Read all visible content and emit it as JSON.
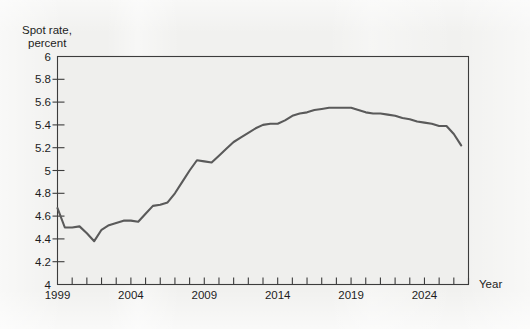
{
  "figure": {
    "background_color": "#f1f1ef",
    "plot_background_color": "#efefed",
    "line_color": "#5a5a5a",
    "axis_color": "#3c3c3c",
    "text_color": "#1d1d1d"
  },
  "axes": {
    "y_title_line1": "Spot rate,",
    "y_title_line2": "percent",
    "x_title": "Year"
  },
  "chart_data": {
    "type": "line",
    "title": "",
    "subtitle": "",
    "xlabel": "Year",
    "ylabel": "Spot rate, percent",
    "xlim": [
      1999,
      2027
    ],
    "ylim": [
      4,
      6
    ],
    "grid": false,
    "legend": null,
    "y_ticks": [
      4,
      4.2,
      4.4,
      4.6,
      4.8,
      5,
      5.2,
      5.4,
      5.6,
      5.8,
      6
    ],
    "y_tick_labels": [
      "4",
      "4.2",
      "4.4",
      "4.6",
      "4.8",
      "5",
      "5.2",
      "5.4",
      "5.6",
      "5.8",
      "6"
    ],
    "x_ticks": [
      1999,
      2000,
      2001,
      2002,
      2003,
      2004,
      2005,
      2006,
      2007,
      2008,
      2009,
      2010,
      2011,
      2012,
      2013,
      2014,
      2015,
      2016,
      2017,
      2018,
      2019,
      2020,
      2021,
      2022,
      2023,
      2024,
      2025,
      2026,
      2027
    ],
    "x_tick_labels": [
      "1999",
      "",
      "",
      "",
      "",
      "2004",
      "",
      "",
      "",
      "",
      "2009",
      "",
      "",
      "",
      "",
      "2014",
      "",
      "",
      "",
      "",
      "2019",
      "",
      "",
      "",
      "",
      "2024",
      "",
      "",
      ""
    ],
    "x_labeled_ticks": [
      1999,
      2004,
      2009,
      2014,
      2019,
      2024
    ],
    "series": [
      {
        "name": "Spot rate",
        "x": [
          1999,
          1999.5,
          2000,
          2000.5,
          2001,
          2001.5,
          2002,
          2002.5,
          2003,
          2003.5,
          2004,
          2004.5,
          2005,
          2005.5,
          2006,
          2006.5,
          2007,
          2007.5,
          2008,
          2008.5,
          2009,
          2009.5,
          2010,
          2010.5,
          2011,
          2011.5,
          2012,
          2012.5,
          2013,
          2013.5,
          2014,
          2014.5,
          2015,
          2015.5,
          2016,
          2016.5,
          2017,
          2017.5,
          2018,
          2018.5,
          2019,
          2019.5,
          2020,
          2020.5,
          2021,
          2021.5,
          2022,
          2022.5,
          2023,
          2023.5,
          2024,
          2024.5,
          2025,
          2025.5,
          2026,
          2026.5
        ],
        "y": [
          4.67,
          4.5,
          4.5,
          4.51,
          4.45,
          4.38,
          4.48,
          4.52,
          4.54,
          4.56,
          4.56,
          4.55,
          4.62,
          4.69,
          4.7,
          4.72,
          4.8,
          4.9,
          5.0,
          5.09,
          5.08,
          5.07,
          5.13,
          5.19,
          5.25,
          5.29,
          5.33,
          5.37,
          5.4,
          5.41,
          5.41,
          5.44,
          5.48,
          5.5,
          5.51,
          5.53,
          5.54,
          5.55,
          5.55,
          5.55,
          5.55,
          5.53,
          5.51,
          5.5,
          5.5,
          5.49,
          5.48,
          5.46,
          5.45,
          5.43,
          5.42,
          5.41,
          5.39,
          5.39,
          5.32,
          5.22
        ]
      }
    ]
  }
}
